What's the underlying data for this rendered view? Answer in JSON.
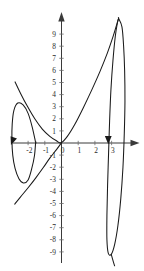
{
  "figure": {
    "width": 144,
    "height": 271,
    "background_color": "#ffffff",
    "curve_color": "#1a1a1a",
    "axis_color": "#3a3a3a",
    "label_color": "#2b2b2b"
  },
  "chart_data": {
    "type": "line",
    "title": "",
    "subtitle": "",
    "xlabel": "",
    "ylabel": "",
    "grid": false,
    "legend": null,
    "annotations": [],
    "axes": {
      "origin_px": [
        61.5,
        143.0
      ],
      "x_unit_px": 16.7,
      "y_unit_px": 12.1,
      "xlim": [
        -2.9,
        4.4
      ],
      "ylim": [
        -10.5,
        10.6
      ],
      "x_axis_arrow": "right",
      "y_axis_arrow": "up"
    },
    "x_ticks": [
      -2,
      -1,
      0,
      1,
      2,
      3
    ],
    "x_tick_labels": [
      "-2",
      "-1",
      "0",
      "1",
      "2",
      "3"
    ],
    "y_ticks": [
      -9,
      -8,
      -7,
      -6,
      -5,
      -4,
      -3,
      -2,
      -1,
      1,
      2,
      3,
      4,
      5,
      6,
      7,
      8,
      9
    ],
    "y_tick_labels": [
      "-9",
      "-8",
      "-7",
      "-6",
      "-5",
      "-4",
      "-3",
      "-2",
      "-1",
      "1",
      "2",
      "3",
      "4",
      "5",
      "6",
      "7",
      "8",
      "9"
    ],
    "series": [
      {
        "name": "left-loop",
        "description": "small closed oval loop on the negative x side",
        "closed": true,
        "points": [
          [
            -1.55,
            0.05
          ],
          [
            -1.75,
            1.3
          ],
          [
            -2.0,
            2.45
          ],
          [
            -2.3,
            3.15
          ],
          [
            -2.62,
            3.3
          ],
          [
            -2.85,
            2.7
          ],
          [
            -2.95,
            1.6
          ],
          [
            -2.97,
            0.3
          ],
          [
            -2.92,
            -1.0
          ],
          [
            -2.78,
            -2.1
          ],
          [
            -2.55,
            -2.95
          ],
          [
            -2.28,
            -3.3
          ],
          [
            -2.0,
            -3.05
          ],
          [
            -1.78,
            -2.1
          ],
          [
            -1.62,
            -1.05
          ],
          [
            -1.55,
            0.05
          ]
        ]
      },
      {
        "name": "upper-branch",
        "description": "branch rising from lower-left through origin region up to the right peak",
        "closed": false,
        "points": [
          [
            -2.78,
            5.05
          ],
          [
            -2.45,
            4.1
          ],
          [
            -2.05,
            3.05
          ],
          [
            -1.6,
            2.0
          ],
          [
            -1.15,
            1.15
          ],
          [
            -0.7,
            0.55
          ],
          [
            -0.3,
            0.18
          ],
          [
            -0.02,
            0.02
          ],
          [
            0.35,
            0.55
          ],
          [
            0.8,
            1.55
          ],
          [
            1.3,
            2.9
          ],
          [
            1.8,
            4.35
          ],
          [
            2.3,
            5.9
          ],
          [
            2.75,
            7.45
          ],
          [
            3.1,
            8.85
          ],
          [
            3.32,
            9.85
          ],
          [
            3.42,
            10.3
          ]
        ]
      },
      {
        "name": "lower-branch",
        "description": "branch from origin curving down to lower-left",
        "closed": false,
        "points": [
          [
            -0.02,
            -0.02
          ],
          [
            -0.3,
            -0.55
          ],
          [
            -0.7,
            -1.25
          ],
          [
            -1.1,
            -2.05
          ],
          [
            -1.55,
            -2.9
          ],
          [
            -2.0,
            -3.7
          ],
          [
            -2.45,
            -4.45
          ],
          [
            -2.8,
            -5.05
          ]
        ]
      },
      {
        "name": "right-loop",
        "description": "tall narrow closed loop on the positive x side spanning y from about 10.3 down to -9.3",
        "closed": true,
        "points": [
          [
            3.42,
            10.3
          ],
          [
            3.62,
            9.6
          ],
          [
            3.72,
            8.0
          ],
          [
            3.78,
            6.0
          ],
          [
            3.8,
            3.5
          ],
          [
            3.76,
            0.8
          ],
          [
            3.68,
            -2.0
          ],
          [
            3.55,
            -4.6
          ],
          [
            3.38,
            -6.8
          ],
          [
            3.18,
            -8.4
          ],
          [
            2.98,
            -9.2
          ],
          [
            2.8,
            -9.1
          ],
          [
            2.72,
            -8.0
          ],
          [
            2.72,
            -6.0
          ],
          [
            2.76,
            -3.5
          ],
          [
            2.82,
            -0.8
          ],
          [
            2.88,
            1.8
          ],
          [
            2.96,
            4.4
          ],
          [
            3.08,
            6.8
          ],
          [
            3.22,
            8.8
          ],
          [
            3.35,
            9.95
          ],
          [
            3.42,
            10.3
          ]
        ]
      },
      {
        "name": "right-descending-tail",
        "description": "short tail continuing below the bottom of the right loop",
        "closed": false,
        "points": [
          [
            2.98,
            -9.2
          ],
          [
            3.08,
            -9.7
          ],
          [
            3.18,
            -10.15
          ]
        ]
      }
    ],
    "direction_arrows": [
      {
        "name": "left-loop-arrow",
        "at": [
          -2.95,
          0.12
        ],
        "direction": "down-left",
        "angle_deg": 250
      },
      {
        "name": "right-loop-arrow",
        "at": [
          2.8,
          0.2
        ],
        "direction": "down",
        "angle_deg": 270
      }
    ]
  }
}
